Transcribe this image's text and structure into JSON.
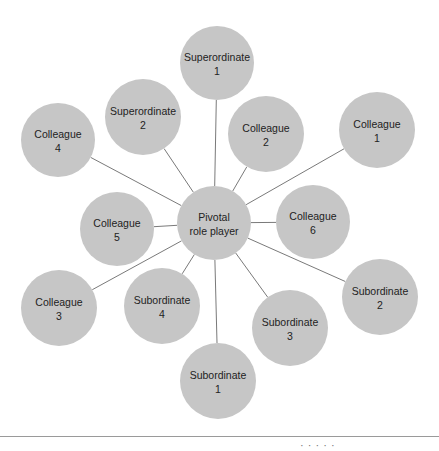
{
  "diagram": {
    "colors": {
      "node_fill": "#c6c6c6",
      "connector": "#6a6a6a",
      "text": "#222222"
    },
    "hub": {
      "id": "pivotal",
      "line1": "Pivotal",
      "line2": "role player",
      "cx": 214,
      "cy": 223,
      "r": 37
    },
    "nodes": [
      {
        "id": "superordinate-1",
        "line1": "Superordinate",
        "line2": "1",
        "cx": 217,
        "cy": 63,
        "r": 37
      },
      {
        "id": "superordinate-2",
        "line1": "Superordinate",
        "line2": "2",
        "cx": 143,
        "cy": 117,
        "r": 38
      },
      {
        "id": "colleague-4",
        "line1": "Colleague",
        "line2": "4",
        "cx": 58,
        "cy": 140,
        "r": 37
      },
      {
        "id": "colleague-2",
        "line1": "Colleague",
        "line2": "2",
        "cx": 266,
        "cy": 134,
        "r": 38
      },
      {
        "id": "colleague-1",
        "line1": "Colleague",
        "line2": "1",
        "cx": 377,
        "cy": 130,
        "r": 38
      },
      {
        "id": "colleague-5",
        "line1": "Colleague",
        "line2": "5",
        "cx": 117,
        "cy": 229,
        "r": 37
      },
      {
        "id": "colleague-6",
        "line1": "Colleague",
        "line2": "6",
        "cx": 313,
        "cy": 222,
        "r": 37
      },
      {
        "id": "colleague-3",
        "line1": "Colleague",
        "line2": "3",
        "cx": 59,
        "cy": 308,
        "r": 38
      },
      {
        "id": "subordinate-4",
        "line1": "Subordinate",
        "line2": "4",
        "cx": 162,
        "cy": 306,
        "r": 38
      },
      {
        "id": "subordinate-3",
        "line1": "Subordinate",
        "line2": "3",
        "cx": 290,
        "cy": 328,
        "r": 38
      },
      {
        "id": "subordinate-2",
        "line1": "Subordinate",
        "line2": "2",
        "cx": 380,
        "cy": 297,
        "r": 38
      },
      {
        "id": "subordinate-1",
        "line1": "Subordinate",
        "line2": "1",
        "cx": 218,
        "cy": 381,
        "r": 38
      }
    ],
    "edges": [
      {
        "from": "pivotal",
        "to": "superordinate-1"
      },
      {
        "from": "pivotal",
        "to": "superordinate-2"
      },
      {
        "from": "pivotal",
        "to": "colleague-4"
      },
      {
        "from": "pivotal",
        "to": "colleague-2"
      },
      {
        "from": "pivotal",
        "to": "colleague-1"
      },
      {
        "from": "pivotal",
        "to": "colleague-5"
      },
      {
        "from": "pivotal",
        "to": "colleague-6"
      },
      {
        "from": "pivotal",
        "to": "colleague-3"
      },
      {
        "from": "pivotal",
        "to": "subordinate-4"
      },
      {
        "from": "pivotal",
        "to": "subordinate-3"
      },
      {
        "from": "pivotal",
        "to": "subordinate-2"
      },
      {
        "from": "pivotal",
        "to": "subordinate-1"
      }
    ]
  },
  "footer": {
    "text": "·  ·    ·     ·    ·"
  }
}
